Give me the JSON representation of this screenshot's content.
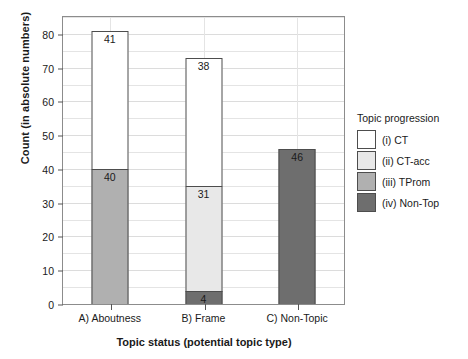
{
  "chart_data": {
    "type": "bar",
    "subtype": "stacked-bar",
    "title": "",
    "xlabel": "Topic status (potential topic type)",
    "ylabel": "Count (in absolute numbers)",
    "categories": [
      "A) Aboutness",
      "B) Frame",
      "C) Non-Topic"
    ],
    "ylim": [
      0,
      85
    ],
    "yticks": [
      0,
      10,
      20,
      30,
      40,
      50,
      60,
      70,
      80
    ],
    "ytick_labels": [
      "0",
      "10",
      "20",
      "30",
      "40",
      "50",
      "60",
      "70",
      "80"
    ],
    "minor_tick_step": 5,
    "grid": true,
    "legend_position": "right",
    "legend_title": "Topic progression",
    "series": [
      {
        "name": "(iv) Non-Top",
        "color": "#6e6e6e",
        "values": [
          0,
          4,
          46
        ],
        "labels": [
          "",
          "4",
          "46"
        ]
      },
      {
        "name": "(iii) TProm",
        "color": "#b0b0b0",
        "values": [
          40,
          0,
          0
        ],
        "labels": [
          "40",
          "",
          ""
        ]
      },
      {
        "name": "(ii) CT-acc",
        "color": "#e8e8e8",
        "values": [
          0,
          31,
          0
        ],
        "labels": [
          "",
          "31",
          ""
        ]
      },
      {
        "name": "(i) CT",
        "color": "#ffffff",
        "values": [
          41,
          38,
          0
        ],
        "labels": [
          "41",
          "38",
          ""
        ]
      }
    ],
    "totals": [
      81,
      73,
      46
    ],
    "annotations": []
  },
  "legend": {
    "title": "Topic progression",
    "items": [
      {
        "label": "(i) CT",
        "color": "#ffffff"
      },
      {
        "label": "(ii) CT-acc",
        "color": "#e8e8e8"
      },
      {
        "label": "(iii) TProm",
        "color": "#b0b0b0"
      },
      {
        "label": "(iv) Non-Top",
        "color": "#6e6e6e"
      }
    ]
  }
}
